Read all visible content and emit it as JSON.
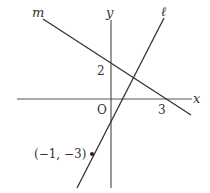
{
  "diagram": {
    "axes": {
      "x_label": "x",
      "y_label": "y",
      "origin_label": "O"
    },
    "lines": [
      {
        "name": "m",
        "label": "m",
        "y_intercept": 2,
        "x_intercept": 3
      },
      {
        "name": "l",
        "label": "ℓ",
        "passes_through": "(−1, −3)"
      }
    ],
    "tick_labels": {
      "y_tick": "2",
      "x_tick": "3"
    },
    "point_label": "(−1, −3)",
    "colors": {
      "stroke": "#333333",
      "background": "#ffffff"
    }
  }
}
